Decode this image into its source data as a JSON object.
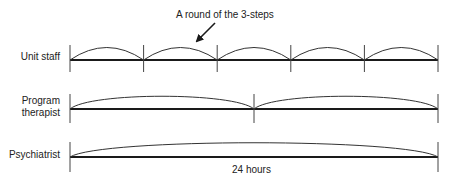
{
  "annotation": {
    "text": "A round of the 3-steps",
    "arrow": "arrow-down-left"
  },
  "rows": [
    {
      "label": "Unit staff",
      "segments": 5
    },
    {
      "label_line1": "Program",
      "label_line2": "therapist",
      "segments": 2
    },
    {
      "label": "Psychiatrist",
      "segments": 1
    }
  ],
  "duration_label": "24 hours",
  "colors": {
    "line": "#1a1a1a",
    "arc": "#333333",
    "tick": "#444444",
    "text": "#222222"
  }
}
